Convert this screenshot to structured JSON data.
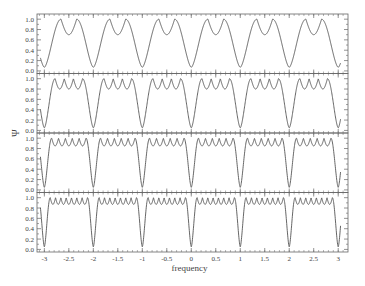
{
  "chart_data": {
    "type": "line",
    "title": "",
    "xlabel": "frequency",
    "ylabel": "Ψ",
    "xlim": [
      -3.15,
      3.2
    ],
    "ylim": [
      -0.05,
      1.1
    ],
    "x_ticks": [
      -3,
      -2.5,
      -2,
      -1.5,
      -1,
      -0.5,
      0,
      0.5,
      1,
      1.5,
      2,
      2.5,
      3
    ],
    "x_tick_labels": [
      "-3",
      "-2.5",
      "-2",
      "-1.5",
      "-1",
      "-0.5",
      "0",
      "0.5",
      "1",
      "1.5",
      "2",
      "2.5",
      "3"
    ],
    "y_ticks": [
      0.0,
      0.2,
      0.4,
      0.6,
      0.8,
      1.0
    ],
    "y_tick_labels": [
      "0.0",
      "0.2",
      "0.4",
      "0.6",
      "0.8",
      "1.0"
    ],
    "grid": false,
    "legend": null,
    "panels": [
      {
        "name": "panel-1",
        "period_min": 0.07,
        "peaks": 2,
        "dip": 0.7,
        "edge_width": 0.34
      },
      {
        "name": "panel-2",
        "period_min": 0.05,
        "peaks": 4,
        "dip": 0.8,
        "edge_width": 0.22
      },
      {
        "name": "panel-3",
        "period_min": 0.05,
        "peaks": 6,
        "dip": 0.85,
        "edge_width": 0.15
      },
      {
        "name": "panel-4",
        "period_min": 0.05,
        "peaks": 8,
        "dip": 0.87,
        "edge_width": 0.12
      }
    ],
    "line_color": "#555555"
  }
}
